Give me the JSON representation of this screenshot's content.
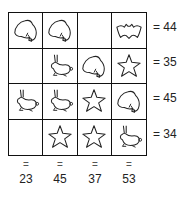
{
  "puzzle": {
    "grid": [
      [
        "frog",
        "frog",
        "",
        "bat"
      ],
      [
        "",
        "rabbit",
        "frog",
        "star"
      ],
      [
        "rabbit",
        "rabbit",
        "star",
        "frog"
      ],
      [
        "",
        "star",
        "star",
        "rabbit"
      ]
    ],
    "row_sums": [
      "= 44",
      "= 35",
      "= 45",
      "= 34"
    ],
    "col_equals": [
      "=",
      "=",
      "=",
      "="
    ],
    "col_sums": [
      "23",
      "45",
      "37",
      "53"
    ]
  }
}
